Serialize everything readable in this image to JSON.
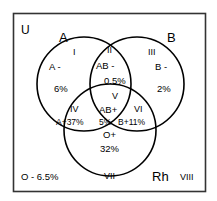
{
  "diagram": {
    "universe_label": "U",
    "frame": {
      "stroke": "#1a1a1a",
      "fill": "#ffffff"
    },
    "circle_stroke": "#000000",
    "text_color": "#000000",
    "sets": [
      {
        "id": "set-a",
        "label": "A",
        "meaning": "A antigen"
      },
      {
        "id": "set-b",
        "label": "B",
        "meaning": "B antigen"
      },
      {
        "id": "set-rh",
        "label": "Rh",
        "meaning": "Rh antigen"
      }
    ],
    "regions": [
      {
        "id": "region-1",
        "roman": "I",
        "line1": "A -",
        "line2": "6%"
      },
      {
        "id": "region-2",
        "roman": "II",
        "line1": "AB -",
        "line2": "0.5%"
      },
      {
        "id": "region-3",
        "roman": "III",
        "line1": "B -",
        "line2": "2%"
      },
      {
        "id": "region-4",
        "roman": "IV",
        "line1": "A+37%",
        "line2": ""
      },
      {
        "id": "region-5",
        "roman": "V",
        "line1": "AB+",
        "line2": "5%"
      },
      {
        "id": "region-6",
        "roman": "VI",
        "line1": "B+11%",
        "line2": ""
      },
      {
        "id": "region-7",
        "roman": "VII",
        "line1": "O+",
        "line2": "32%"
      },
      {
        "id": "region-8",
        "roman": "VIII",
        "line1": "O - 6.5%",
        "line2": ""
      }
    ],
    "labels": {
      "roman_1": "I",
      "roman_2": "II",
      "roman_3": "III",
      "roman_4": "IV",
      "roman_5": "V",
      "roman_6": "VI",
      "roman_7": "VII",
      "roman_8": "VIII",
      "a_minus": "A -",
      "a_minus_pct": "6%",
      "ab_minus": "AB -",
      "ab_minus_pct": "0.5%",
      "b_minus": "B -",
      "b_minus_pct": "2%",
      "a_plus": "A+37%",
      "ab_plus": "AB+",
      "ab_plus_pct": "5%",
      "b_plus": "B+11%",
      "o_plus": "O+",
      "o_plus_pct": "32%",
      "o_minus": "O - 6.5%"
    }
  }
}
